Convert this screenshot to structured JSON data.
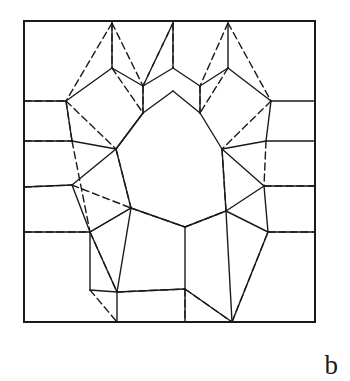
{
  "figure": {
    "panel_label": "b",
    "caption_label_position": "bottom-right",
    "title": "",
    "frame": {
      "x": 24,
      "y": 21,
      "width": 291,
      "height": 301,
      "stroke": "#1a1a1a",
      "stroke_width": 2.0
    },
    "style": {
      "background": "#ffffff",
      "solid_stroke": "#1a1a1a",
      "dashed_stroke": "#1a1a1a",
      "solid_width": 1.4,
      "dashed_width": 1.4,
      "dash_pattern": "7,4"
    },
    "solid_edges": [
      [
        112,
        23,
        112,
        68
      ],
      [
        112,
        68,
        143,
        86
      ],
      [
        143,
        86,
        173,
        68
      ],
      [
        173,
        68,
        173,
        23
      ],
      [
        228,
        23,
        228,
        68
      ],
      [
        228,
        68,
        200,
        86
      ],
      [
        200,
        86,
        173,
        68
      ],
      [
        112,
        68,
        66,
        101
      ],
      [
        66,
        101,
        24,
        101
      ],
      [
        66,
        101,
        72,
        141
      ],
      [
        72,
        141,
        24,
        141
      ],
      [
        72,
        141,
        116,
        149
      ],
      [
        116,
        149,
        143,
        113
      ],
      [
        143,
        113,
        143,
        86
      ],
      [
        143,
        113,
        116,
        149
      ],
      [
        228,
        68,
        271,
        101
      ],
      [
        271,
        101,
        315,
        101
      ],
      [
        271,
        101,
        266,
        141
      ],
      [
        266,
        141,
        315,
        141
      ],
      [
        266,
        141,
        222,
        149
      ],
      [
        222,
        149,
        200,
        113
      ],
      [
        200,
        113,
        200,
        86
      ],
      [
        143,
        113,
        173,
        91
      ],
      [
        173,
        91,
        200,
        113
      ],
      [
        116,
        149,
        131,
        208
      ],
      [
        131,
        208,
        185,
        227
      ],
      [
        185,
        227,
        226,
        211
      ],
      [
        226,
        211,
        222,
        149
      ],
      [
        131,
        208,
        131,
        208
      ],
      [
        24,
        187,
        72,
        185
      ],
      [
        72,
        185,
        116,
        149
      ],
      [
        72,
        185,
        90,
        232
      ],
      [
        90,
        232,
        131,
        208
      ],
      [
        90,
        232,
        117,
        292
      ],
      [
        117,
        292,
        131,
        208
      ],
      [
        24,
        232,
        90,
        232
      ],
      [
        117,
        292,
        185,
        289
      ],
      [
        185,
        289,
        185,
        227
      ],
      [
        185,
        289,
        232,
        322
      ],
      [
        232,
        322,
        226,
        211
      ],
      [
        226,
        211,
        268,
        232
      ],
      [
        268,
        232,
        315,
        232
      ],
      [
        268,
        232,
        264,
        186
      ],
      [
        264,
        186,
        315,
        186
      ],
      [
        264,
        186,
        226,
        211
      ],
      [
        222,
        149,
        264,
        186
      ],
      [
        90,
        232,
        90,
        290
      ],
      [
        90,
        290,
        117,
        292
      ],
      [
        117,
        292,
        117,
        322
      ],
      [
        185,
        289,
        185,
        322
      ],
      [
        232,
        322,
        268,
        232
      ],
      [
        131,
        208,
        90,
        232
      ]
    ],
    "dashed_edges": [
      [
        112,
        23,
        66,
        101
      ],
      [
        112,
        23,
        143,
        86
      ],
      [
        143,
        86,
        173,
        23
      ],
      [
        173,
        23,
        173,
        68
      ],
      [
        228,
        23,
        271,
        101
      ],
      [
        228,
        23,
        200,
        86
      ],
      [
        24,
        101,
        66,
        101
      ],
      [
        66,
        101,
        72,
        141
      ],
      [
        24,
        141,
        72,
        141
      ],
      [
        143,
        86,
        143,
        113
      ],
      [
        200,
        86,
        200,
        113
      ],
      [
        112,
        68,
        143,
        113
      ],
      [
        228,
        68,
        200,
        113
      ],
      [
        66,
        101,
        116,
        149
      ],
      [
        271,
        101,
        222,
        149
      ],
      [
        72,
        141,
        90,
        232
      ],
      [
        266,
        141,
        264,
        186
      ],
      [
        24,
        187,
        72,
        185
      ],
      [
        72,
        185,
        131,
        208
      ],
      [
        131,
        208,
        185,
        227
      ],
      [
        185,
        227,
        226,
        211
      ],
      [
        24,
        232,
        90,
        232
      ],
      [
        90,
        232,
        117,
        292
      ],
      [
        117,
        292,
        185,
        289
      ],
      [
        185,
        289,
        232,
        322
      ],
      [
        232,
        322,
        268,
        232
      ],
      [
        268,
        232,
        315,
        232
      ],
      [
        315,
        186,
        264,
        186
      ],
      [
        116,
        149,
        131,
        208
      ],
      [
        222,
        149,
        226,
        211
      ],
      [
        90,
        290,
        117,
        322
      ],
      [
        185,
        289,
        185,
        322
      ],
      [
        112,
        23,
        112,
        68
      ],
      [
        173,
        23,
        143,
        86
      ]
    ]
  }
}
